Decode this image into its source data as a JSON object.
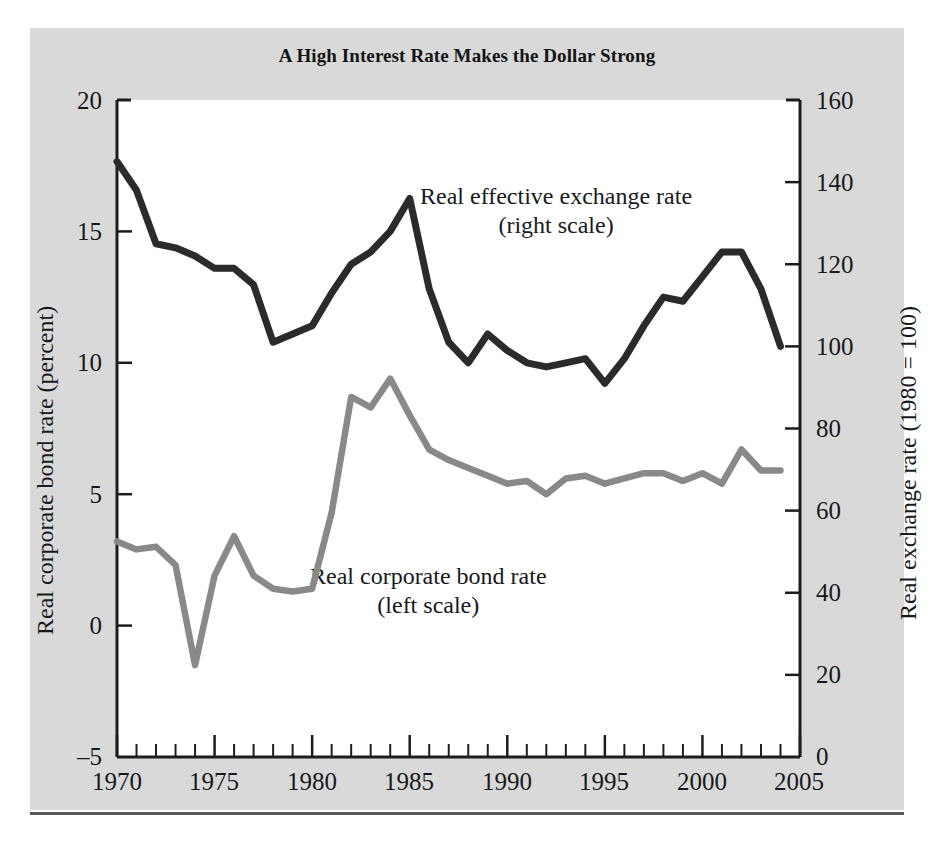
{
  "figure": {
    "title": "A High Interest Rate Makes the Dollar Strong",
    "background_color": "#d9d9d9",
    "plot_background_color": "#ffffff",
    "annotations": [
      {
        "name": "exchange-rate-annotation",
        "line1": "Real effective exchange rate",
        "line2": "(right scale)"
      },
      {
        "name": "bond-rate-annotation",
        "line1": "Real corporate bond rate",
        "line2": "(left scale)"
      }
    ]
  },
  "chart_data": {
    "type": "line",
    "title": "A High Interest Rate Makes the Dollar Strong",
    "xlabel": "",
    "xlim": [
      1970,
      2005
    ],
    "xticks": [
      1970,
      1975,
      1980,
      1985,
      1990,
      1995,
      2000,
      2005
    ],
    "xtick_labels": [
      "1970",
      "1975",
      "1980",
      "1985",
      "1990",
      "1995",
      "2000",
      "2005"
    ],
    "x_minor_tick_step": 1,
    "grid": false,
    "legend": "inline-annotations",
    "axes": [
      {
        "id": "left",
        "label": "Real corporate bond rate (percent)",
        "lim": [
          -5,
          20
        ],
        "ticks": [
          -5,
          0,
          5,
          10,
          15,
          20
        ],
        "tick_labels": [
          "–5",
          "0",
          "5",
          "10",
          "15",
          "20"
        ]
      },
      {
        "id": "right",
        "label": "Real exchange rate (1980 = 100)",
        "lim": [
          0,
          160
        ],
        "ticks": [
          0,
          20,
          40,
          60,
          80,
          100,
          120,
          140,
          160
        ],
        "tick_labels": [
          "0",
          "20",
          "40",
          "60",
          "80",
          "100",
          "120",
          "140",
          "160"
        ]
      }
    ],
    "series": [
      {
        "name": "Real effective exchange rate",
        "scale": "right",
        "color": "#2b2b2b",
        "x": [
          1970,
          1971,
          1972,
          1973,
          1974,
          1975,
          1976,
          1977,
          1978,
          1979,
          1980,
          1981,
          1982,
          1983,
          1984,
          1985,
          1986,
          1987,
          1988,
          1989,
          1990,
          1991,
          1992,
          1993,
          1994,
          1995,
          1996,
          1997,
          1998,
          1999,
          2000,
          2001,
          2002,
          2003,
          2004
        ],
        "values": [
          145,
          138,
          125,
          124,
          122,
          119,
          119,
          115,
          101,
          103,
          105,
          113,
          120,
          123,
          128,
          136,
          114,
          101,
          96,
          103,
          99,
          96,
          95,
          96,
          97,
          91,
          97,
          105,
          112,
          111,
          117,
          123,
          123,
          114,
          100
        ]
      },
      {
        "name": "Real corporate bond rate",
        "scale": "left",
        "color": "#898989",
        "x": [
          1970,
          1971,
          1972,
          1973,
          1974,
          1975,
          1976,
          1977,
          1978,
          1979,
          1980,
          1981,
          1982,
          1983,
          1984,
          1985,
          1986,
          1987,
          1988,
          1989,
          1990,
          1991,
          1992,
          1993,
          1994,
          1995,
          1996,
          1997,
          1998,
          1999,
          2000,
          2001,
          2002,
          2003,
          2004
        ],
        "values": [
          3.2,
          2.9,
          3.0,
          2.3,
          -1.5,
          1.9,
          3.4,
          1.9,
          1.4,
          1.3,
          1.4,
          4.3,
          8.7,
          8.3,
          9.4,
          8.0,
          6.7,
          6.3,
          6.0,
          5.7,
          5.4,
          5.5,
          5.0,
          5.6,
          5.7,
          5.4,
          5.6,
          5.8,
          5.8,
          5.5,
          5.8,
          5.4,
          6.7,
          5.9,
          5.9
        ]
      }
    ]
  },
  "ticks": {
    "left": [
      "20",
      "15",
      "10",
      "5",
      "0",
      "–5"
    ],
    "right": [
      "160",
      "140",
      "120",
      "100",
      "80",
      "60",
      "40",
      "20",
      "0"
    ],
    "x": [
      "1970",
      "1975",
      "1980",
      "1985",
      "1990",
      "1995",
      "2000",
      "2005"
    ]
  },
  "axis_titles": {
    "left": "Real corporate bond rate (percent)",
    "right": "Real exchange rate (1980 = 100)"
  }
}
